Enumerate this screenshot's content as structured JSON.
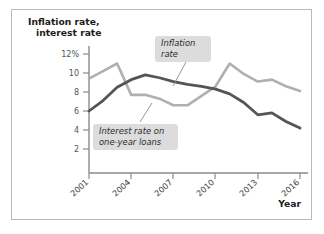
{
  "chart_data": {
    "type": "line",
    "title": "",
    "xlabel": "Year",
    "ylabel": "Inflation rate, interest rate",
    "xlim": [
      2001,
      2016
    ],
    "ylim": [
      0,
      12.8
    ],
    "grid": false,
    "legend_position": "inline-callouts",
    "x": [
      2001,
      2002,
      2003,
      2004,
      2005,
      2006,
      2007,
      2008,
      2009,
      2010,
      2011,
      2012,
      2013,
      2014,
      2015,
      2016
    ],
    "series": [
      {
        "name": "Inflation rate",
        "color": "#b0b0b0",
        "values": [
          9.4,
          10.2,
          11.0,
          7.7,
          7.7,
          7.3,
          6.6,
          6.6,
          7.6,
          8.6,
          11.0,
          9.9,
          9.1,
          9.3,
          8.6,
          8.1
        ]
      },
      {
        "name": "Interest rate on one-year loans",
        "color": "#555555",
        "values": [
          6.0,
          7.1,
          8.5,
          9.3,
          9.8,
          9.5,
          9.1,
          8.8,
          8.6,
          8.3,
          7.8,
          6.9,
          5.6,
          5.8,
          4.9,
          4.2
        ]
      }
    ],
    "y_ticks": [
      {
        "value": 12,
        "label": "12%"
      },
      {
        "value": 10,
        "label": "10"
      },
      {
        "value": 8,
        "label": "8"
      },
      {
        "value": 6,
        "label": "6"
      },
      {
        "value": 4,
        "label": "4"
      },
      {
        "value": 2,
        "label": "2"
      }
    ],
    "x_ticks": [
      {
        "value": 2001,
        "label": "2001"
      },
      {
        "value": 2004,
        "label": "2004"
      },
      {
        "value": 2007,
        "label": "2007"
      },
      {
        "value": 2010,
        "label": "2010"
      },
      {
        "value": 2013,
        "label": "2013"
      },
      {
        "value": 2016,
        "label": "2016"
      }
    ],
    "annotations": [
      {
        "name": "inflation-rate-callout",
        "line1": "Inflation",
        "line2": "rate",
        "points_to_series": "Inflation rate"
      },
      {
        "name": "interest-rate-callout",
        "line1": "Interest rate on",
        "line2": "one-year loans",
        "points_to_series": "Interest rate on one-year loans"
      }
    ],
    "axis_title_lines": [
      "Inflation rate,",
      "interest rate"
    ],
    "colors": {
      "inflation_line": "#b0b0b0",
      "interest_line": "#555555",
      "axis": "#8a8a8a",
      "callout_background": "#dcdcdc",
      "frame_border": "#b9b9b9",
      "text": "#1b1b1b"
    }
  }
}
